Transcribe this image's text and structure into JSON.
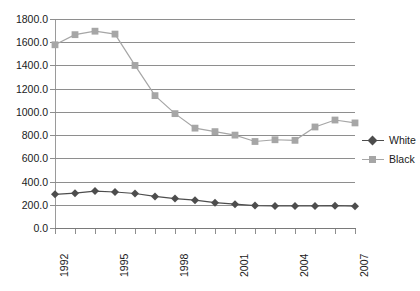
{
  "chart_data": {
    "type": "line",
    "title": "",
    "xlabel": "",
    "ylabel": "",
    "x": [
      1992,
      1993,
      1994,
      1995,
      1996,
      1997,
      1998,
      1999,
      2000,
      2001,
      2002,
      2003,
      2004,
      2005,
      2006,
      2007
    ],
    "xtick_labels": [
      "1992",
      "",
      "",
      "1995",
      "",
      "",
      "1998",
      "",
      "",
      "2001",
      "",
      "",
      "2004",
      "",
      "",
      "2007"
    ],
    "ytick_labels": [
      "0.0",
      "200.0",
      "400.0",
      "600.0",
      "800.0",
      "1000.0",
      "1200.0",
      "1400.0",
      "1600.0",
      "1800.0"
    ],
    "ytick_values": [
      0,
      200,
      400,
      600,
      800,
      1000,
      1200,
      1400,
      1600,
      1800
    ],
    "ylim": [
      0,
      1800
    ],
    "xlim": [
      1992,
      2007
    ],
    "grid": "horizontal",
    "legend_position": "right",
    "series": [
      {
        "name": "White",
        "color": "#4d4d4d",
        "marker": "diamond",
        "values": [
          290,
          300,
          318,
          310,
          297,
          272,
          253,
          240,
          218,
          205,
          193,
          190,
          190,
          190,
          192,
          188
        ]
      },
      {
        "name": "Black",
        "color": "#a6a6a6",
        "marker": "square",
        "values": [
          1578,
          1665,
          1695,
          1670,
          1400,
          1140,
          985,
          860,
          830,
          800,
          745,
          760,
          755,
          870,
          930,
          905
        ]
      }
    ]
  },
  "legend": {
    "items": [
      {
        "label": "White"
      },
      {
        "label": "Black"
      }
    ]
  },
  "colors": {
    "white_series": "#4d4d4d",
    "black_series": "#a6a6a6",
    "gridline": "#8e8e8e",
    "axis": "#8e8e8e",
    "background": "#ffffff"
  }
}
